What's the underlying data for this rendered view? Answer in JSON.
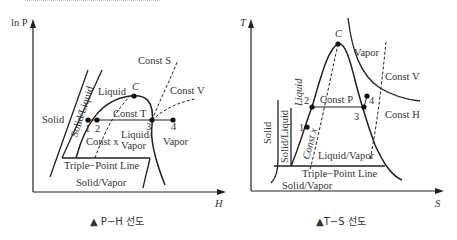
{
  "ph_diagram": {
    "y_axis": "ln P",
    "x_axis": "H",
    "regions": {
      "solid": "Solid",
      "solid_liquid": "Solid/Liquid",
      "liquid": "Liquid",
      "liquid_vapor_1": "Liquid/",
      "liquid_vapor_2": "Vapor",
      "vapor": "Vapor",
      "solid_vapor": "Solid/Vapor"
    },
    "lines": {
      "triple": "Triple−Point Line",
      "const_s": "Const S",
      "const_v": "Const V",
      "const_t": "Const T",
      "const_x": "Const x"
    },
    "points": {
      "c": "C",
      "p1": "1",
      "p2": "2",
      "p3": "3",
      "p4": "4"
    },
    "caption": "▲ P−H 선도"
  },
  "ts_diagram": {
    "y_axis": "T",
    "x_axis": "S",
    "regions": {
      "solid": "Solid",
      "solid_liquid": "Solid/Liquid",
      "liquid": "Liquid",
      "liquid_vapor": "Liquid/Vapor",
      "vapor": "Vapor",
      "solid_vapor": "Solid/Vapor"
    },
    "lines": {
      "triple": "Triple−Point Line",
      "const_p": "Const P",
      "const_v": "Const V",
      "const_h": "Const H",
      "const_x": "Const x"
    },
    "points": {
      "c": "C",
      "p1": "1",
      "p2": "2",
      "p3": "3",
      "p4": "4"
    },
    "caption": "▲T−S 선도"
  }
}
